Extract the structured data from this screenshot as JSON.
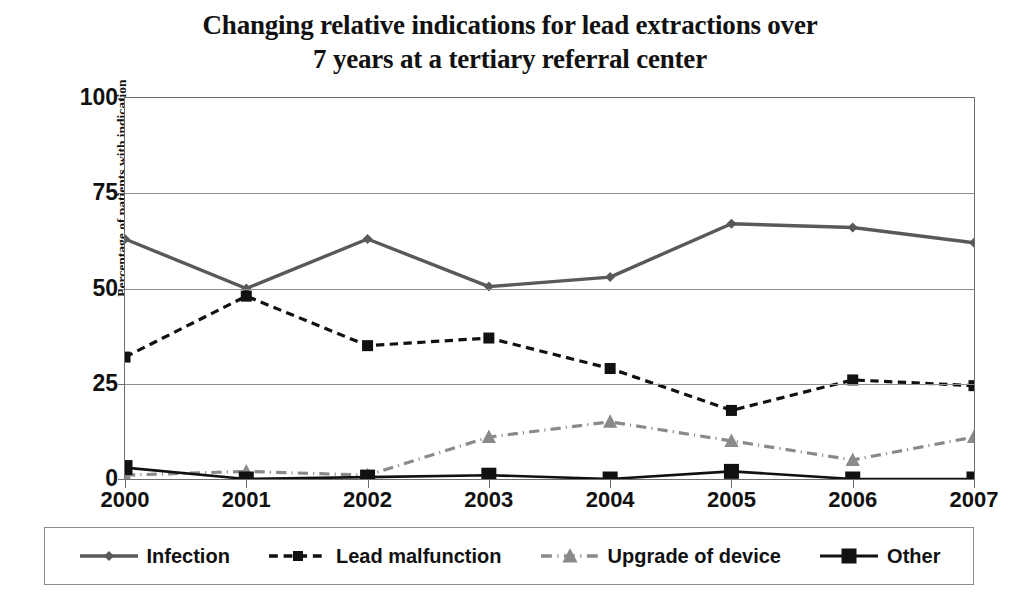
{
  "chart_data": {
    "type": "line",
    "title": "Changing relative indications for lead extractions over 7 years at a tertiary referral center",
    "title_line1": "Changing relative indications for lead extractions over",
    "title_line2": "7 years at a tertiary referral center",
    "xlabel": "",
    "ylabel": "Percentage of patients with indication",
    "categories": [
      "2000",
      "2001",
      "2002",
      "2003",
      "2004",
      "2005",
      "2006",
      "2007"
    ],
    "x": [
      2000,
      2001,
      2002,
      2003,
      2004,
      2005,
      2006,
      2007
    ],
    "ylim": [
      0,
      100
    ],
    "yticks": [
      0,
      25,
      50,
      75,
      100
    ],
    "ytick_labels": [
      "0",
      "25",
      "50",
      "75",
      "100"
    ],
    "grid": "horizontal",
    "legend_position": "bottom",
    "series": [
      {
        "name": "Infection",
        "values": [
          63,
          50,
          63,
          50.5,
          53,
          67,
          66,
          62
        ],
        "color": "#595959",
        "line_style": "solid",
        "marker": "diamond"
      },
      {
        "name": "Lead malfunction",
        "values": [
          32,
          48,
          35,
          37,
          29,
          18,
          26,
          24.5
        ],
        "color": "#111111",
        "line_style": "dashed",
        "marker": "square"
      },
      {
        "name": "Upgrade of device",
        "values": [
          1,
          2,
          1,
          11,
          15,
          10,
          5,
          11
        ],
        "color": "#8a8a8a",
        "line_style": "dash-dot",
        "marker": "triangle"
      },
      {
        "name": "Other",
        "values": [
          3,
          0,
          0.5,
          1,
          0,
          2,
          0,
          0
        ],
        "color": "#111111",
        "line_style": "solid",
        "marker": "square-filled"
      }
    ]
  },
  "legend": {
    "items": [
      {
        "label": "Infection"
      },
      {
        "label": "Lead malfunction"
      },
      {
        "label": "Upgrade of device"
      },
      {
        "label": "Other"
      }
    ]
  },
  "colors": {
    "axis": "#6e6e6e",
    "grid": "#8c8c8c",
    "text": "#111111",
    "background": "#ffffff"
  }
}
